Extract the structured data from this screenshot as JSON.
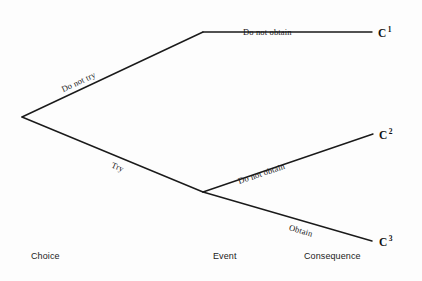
{
  "diagram": {
    "type": "decision-tree",
    "background_color": "#fdfdfd",
    "line_color": "#1a1a1a"
  },
  "nodes": {
    "choice_root": {
      "x": 22,
      "y": 117,
      "label": ""
    },
    "event_upper": {
      "x": 203,
      "y": 32,
      "label": ""
    },
    "event_lower": {
      "x": 203,
      "y": 192,
      "label": ""
    }
  },
  "branches": [
    {
      "id": "do-not-try",
      "label": "Do not try",
      "from": "choice_root",
      "to": "event_upper"
    },
    {
      "id": "try",
      "label": "Try",
      "from": "choice_root",
      "to": "event_lower"
    },
    {
      "id": "upper-do-not-obtain",
      "label": "Do not obtain",
      "from": "event_upper",
      "to": "consequence_1"
    },
    {
      "id": "lower-do-not-obtain",
      "label": "Do not obtain",
      "from": "event_lower",
      "to": "consequence_2"
    },
    {
      "id": "obtain",
      "label": "Obtain",
      "from": "event_lower",
      "to": "consequence_3"
    }
  ],
  "consequences": [
    {
      "id": "c1",
      "symbol": "C",
      "superscript": "1"
    },
    {
      "id": "c2",
      "symbol": "C",
      "superscript": "2"
    },
    {
      "id": "c3",
      "symbol": "C",
      "superscript": "3"
    }
  ],
  "columns": [
    {
      "id": "choice",
      "label": "Choice"
    },
    {
      "id": "event",
      "label": "Event"
    },
    {
      "id": "consequence",
      "label": "Consequence"
    }
  ]
}
